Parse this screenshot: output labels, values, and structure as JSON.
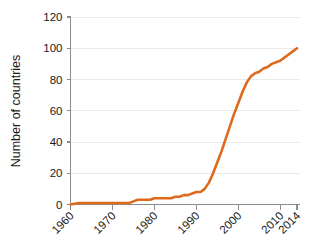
{
  "chart_data": {
    "type": "line",
    "title": "",
    "xlabel": "",
    "ylabel": "Number of countries",
    "xlim": [
      1960,
      2014
    ],
    "ylim": [
      0,
      120
    ],
    "grid": true,
    "legend": false,
    "x_tick_labels": [
      "1960",
      "1970",
      "1980",
      "1990",
      "2000",
      "2010",
      "2014"
    ],
    "x_ticks": [
      1960,
      1970,
      1980,
      1990,
      2000,
      2010,
      2014
    ],
    "y_tick_labels": [
      "0",
      "20",
      "40",
      "60",
      "80",
      "100",
      "120"
    ],
    "y_ticks": [
      0,
      20,
      40,
      60,
      80,
      100,
      120
    ],
    "series": [
      {
        "name": "Number of countries",
        "color": "#dd6b1f",
        "x": [
          1960,
          1962,
          1964,
          1966,
          1968,
          1970,
          1972,
          1974,
          1975,
          1976,
          1977,
          1978,
          1979,
          1980,
          1981,
          1982,
          1983,
          1984,
          1985,
          1986,
          1987,
          1988,
          1989,
          1990,
          1991,
          1992,
          1993,
          1994,
          1995,
          1996,
          1997,
          1998,
          1999,
          2000,
          2001,
          2002,
          2003,
          2004,
          2005,
          2006,
          2007,
          2008,
          2009,
          2010,
          2011,
          2012,
          2013,
          2014
        ],
        "values": [
          0,
          1,
          1,
          1,
          1,
          1,
          1,
          1,
          2,
          3,
          3,
          3,
          3,
          4,
          4,
          4,
          4,
          4,
          5,
          5,
          6,
          6,
          7,
          8,
          8,
          10,
          14,
          20,
          27,
          34,
          42,
          50,
          58,
          65,
          72,
          78,
          82,
          84,
          85,
          87,
          88,
          90,
          91,
          92,
          94,
          96,
          98,
          100
        ]
      }
    ]
  },
  "axis": {
    "y_title": "Number of countries"
  }
}
